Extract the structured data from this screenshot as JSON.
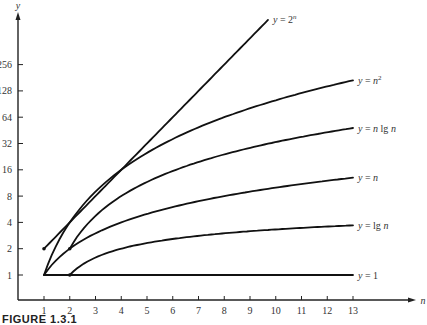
{
  "chart_data": {
    "type": "line",
    "title": "",
    "caption": "FIGURE 1.3.1",
    "xlabel": "n",
    "ylabel": "y",
    "x_ticks": [
      1,
      2,
      3,
      4,
      5,
      6,
      7,
      8,
      9,
      10,
      11,
      12,
      13
    ],
    "y_ticks": [
      1,
      2,
      4,
      8,
      16,
      32,
      64,
      128,
      256
    ],
    "y_scale": "log2",
    "xlim": [
      0,
      16
    ],
    "ylim": [
      0.5,
      900
    ],
    "grid": false,
    "legend": "inline labels at right end of each curve",
    "series": [
      {
        "name": "y = 2^n",
        "label": "y = 2",
        "label_sup": "n",
        "x": [
          1,
          9.7
        ],
        "values": [
          2,
          831
        ],
        "start_marker": true
      },
      {
        "name": "y = n^2",
        "label": "y = n",
        "label_sup": "2",
        "x": [
          1,
          2,
          3,
          4,
          5,
          6,
          7,
          8,
          9,
          10,
          11,
          12,
          13
        ],
        "values": [
          1,
          4,
          9,
          16,
          25,
          36,
          49,
          64,
          81,
          100,
          121,
          144,
          169
        ]
      },
      {
        "name": "y = n lg n",
        "label": "y = n lg n",
        "label_sup": "",
        "x": [
          2,
          3,
          4,
          5,
          6,
          7,
          8,
          9,
          10,
          11,
          12,
          13
        ],
        "values": [
          2,
          4.75,
          8,
          11.6,
          15.5,
          19.7,
          24,
          28.5,
          33.2,
          38.1,
          43,
          48.1
        ],
        "start_marker": true
      },
      {
        "name": "y = n",
        "label": "y = n",
        "label_sup": "",
        "x": [
          1,
          2,
          3,
          4,
          5,
          6,
          7,
          8,
          9,
          10,
          11,
          12,
          13
        ],
        "values": [
          1,
          2,
          3,
          4,
          5,
          6,
          7,
          8,
          9,
          10,
          11,
          12,
          13
        ]
      },
      {
        "name": "y = lg n",
        "label": "y = lg n",
        "label_sup": "",
        "x": [
          2,
          3,
          4,
          5,
          6,
          7,
          8,
          9,
          10,
          11,
          12,
          13
        ],
        "values": [
          1,
          1.58,
          2,
          2.32,
          2.58,
          2.81,
          3,
          3.17,
          3.32,
          3.46,
          3.58,
          3.7
        ],
        "start_marker": true
      },
      {
        "name": "y = 1",
        "label": "y = 1",
        "label_sup": "",
        "x": [
          1,
          13
        ],
        "values": [
          1,
          1
        ]
      }
    ]
  }
}
